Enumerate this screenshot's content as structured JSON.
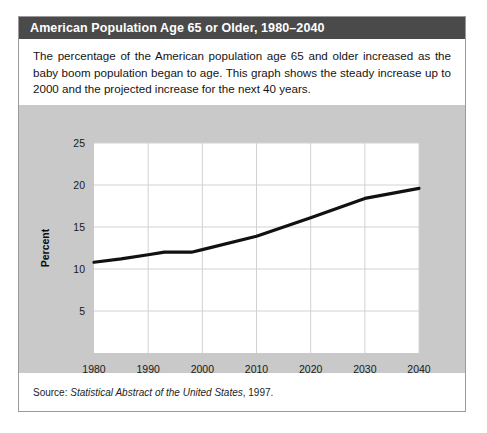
{
  "card": {
    "title": "American Population Age 65 or Older, 1980–2040",
    "description": "The percentage of the American population age 65 and older increased as the baby boom population began to age. This graph shows the steady increase up to 2000 and the projected increase for the next 40 years.",
    "source": {
      "label": "Source: ",
      "publication": "Statistical Abstract of the United States",
      "year": ", 1997."
    }
  },
  "colors": {
    "title_bar_bg": "#4a4a4a",
    "title_text": "#ffffff",
    "panel_bg": "#c9c9c9",
    "plot_bg": "#ffffff",
    "grid": "#d2d2d2",
    "line": "#111111",
    "card_border": "#9a9a9a"
  },
  "chart_data": {
    "type": "line",
    "title": "American Population Age 65 or Older, 1980–2040",
    "xlabel": "",
    "ylabel": "Percent",
    "xlim": [
      1980,
      2040
    ],
    "ylim": [
      0,
      25
    ],
    "xticks": [
      1980,
      1990,
      2000,
      2010,
      2020,
      2030,
      2040
    ],
    "yticks": [
      5,
      10,
      15,
      20,
      25
    ],
    "xtick_labels": [
      "1980",
      "1990",
      "2000",
      "2010",
      "2020",
      "2030",
      "2040"
    ],
    "ytick_labels": [
      "5",
      "10",
      "15",
      "20",
      "25"
    ],
    "grid": true,
    "legend": null,
    "series": [
      {
        "name": "Percent of population age 65 or older",
        "x": [
          1980,
          1985,
          1990,
          1993,
          1998,
          2000,
          2010,
          2020,
          2030,
          2040
        ],
        "values": [
          10.8,
          11.2,
          11.7,
          12.0,
          12.0,
          12.3,
          13.9,
          16.1,
          18.4,
          19.6
        ]
      }
    ]
  }
}
